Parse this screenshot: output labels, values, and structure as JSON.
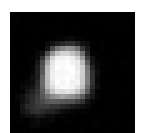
{
  "image": {
    "kind": "grayscale-astronomical-blob",
    "description": "Low-resolution pixelated grayscale image of a small irregular bright object on a black sky background",
    "width_px": 147,
    "height_px": 133,
    "background_color": "#ffffff",
    "field_color": "#000000",
    "field": {
      "left_px": 10,
      "top_px": 12,
      "width_px": 125,
      "height_px": 121
    },
    "colormap": "grayscale",
    "min_level": 0,
    "max_level": 255,
    "block_size_px": 5
  },
  "chart_data": {
    "type": "heatmap",
    "title": "",
    "xlabel": "",
    "ylabel": "",
    "colormap": "gray",
    "vmin": 0,
    "vmax": 255,
    "grid": false,
    "legend": "none",
    "nx": 25,
    "ny": 25,
    "xlim": [
      0,
      25
    ],
    "ylim": [
      0,
      25
    ],
    "xticklabels": [],
    "yticklabels": [],
    "values": [
      [
        0,
        0,
        0,
        0,
        0,
        0,
        0,
        0,
        0,
        0,
        0,
        0,
        0,
        0,
        0,
        0,
        0,
        0,
        0,
        0,
        0,
        0,
        0,
        0,
        0
      ],
      [
        0,
        0,
        0,
        0,
        0,
        0,
        0,
        0,
        0,
        0,
        0,
        0,
        0,
        0,
        0,
        0,
        0,
        0,
        0,
        0,
        0,
        0,
        0,
        0,
        0
      ],
      [
        0,
        0,
        0,
        0,
        0,
        0,
        0,
        0,
        0,
        0,
        0,
        0,
        0,
        0,
        0,
        0,
        0,
        0,
        0,
        0,
        0,
        0,
        0,
        0,
        0
      ],
      [
        0,
        0,
        0,
        0,
        0,
        0,
        0,
        0,
        0,
        0,
        0,
        0,
        0,
        0,
        0,
        0,
        0,
        0,
        0,
        0,
        0,
        0,
        0,
        0,
        0
      ],
      [
        0,
        0,
        0,
        0,
        0,
        0,
        0,
        0,
        0,
        0,
        0,
        0,
        0,
        0,
        0,
        0,
        0,
        0,
        0,
        0,
        0,
        0,
        0,
        0,
        0
      ],
      [
        0,
        0,
        0,
        0,
        0,
        0,
        0,
        0,
        2,
        4,
        6,
        8,
        8,
        6,
        4,
        2,
        0,
        0,
        0,
        0,
        0,
        0,
        0,
        0,
        0
      ],
      [
        0,
        0,
        0,
        0,
        0,
        0,
        0,
        4,
        14,
        30,
        42,
        46,
        44,
        34,
        18,
        6,
        2,
        0,
        0,
        0,
        0,
        0,
        0,
        0,
        0
      ],
      [
        0,
        0,
        0,
        0,
        0,
        0,
        6,
        26,
        72,
        118,
        140,
        146,
        138,
        112,
        62,
        20,
        4,
        0,
        0,
        0,
        0,
        0,
        0,
        0,
        0
      ],
      [
        0,
        0,
        0,
        0,
        0,
        4,
        22,
        78,
        150,
        192,
        206,
        208,
        200,
        172,
        112,
        40,
        8,
        2,
        0,
        0,
        0,
        0,
        0,
        0,
        0
      ],
      [
        0,
        0,
        0,
        0,
        2,
        10,
        48,
        130,
        206,
        234,
        240,
        242,
        238,
        216,
        158,
        66,
        16,
        4,
        0,
        0,
        0,
        0,
        0,
        0,
        0
      ],
      [
        0,
        0,
        0,
        0,
        4,
        18,
        72,
        168,
        228,
        246,
        250,
        252,
        248,
        234,
        186,
        92,
        26,
        6,
        2,
        0,
        0,
        0,
        0,
        0,
        0
      ],
      [
        0,
        0,
        0,
        2,
        8,
        26,
        88,
        184,
        236,
        250,
        252,
        252,
        250,
        240,
        200,
        112,
        36,
        10,
        2,
        0,
        0,
        0,
        0,
        0,
        0
      ],
      [
        0,
        0,
        0,
        2,
        10,
        30,
        96,
        190,
        238,
        250,
        252,
        252,
        250,
        242,
        206,
        124,
        44,
        12,
        2,
        0,
        0,
        0,
        0,
        0,
        0
      ],
      [
        0,
        0,
        0,
        4,
        12,
        34,
        100,
        192,
        238,
        250,
        252,
        252,
        250,
        242,
        208,
        130,
        50,
        14,
        2,
        0,
        0,
        0,
        0,
        0,
        0
      ],
      [
        0,
        0,
        2,
        6,
        16,
        40,
        102,
        188,
        234,
        248,
        250,
        250,
        248,
        238,
        202,
        128,
        50,
        14,
        2,
        0,
        0,
        0,
        0,
        0,
        0
      ],
      [
        0,
        0,
        4,
        10,
        24,
        48,
        100,
        178,
        224,
        242,
        246,
        246,
        242,
        228,
        186,
        114,
        42,
        12,
        2,
        0,
        0,
        0,
        0,
        0,
        0
      ],
      [
        0,
        2,
        8,
        18,
        34,
        56,
        94,
        154,
        196,
        218,
        226,
        224,
        216,
        196,
        152,
        86,
        30,
        8,
        2,
        0,
        0,
        0,
        0,
        0,
        0
      ],
      [
        0,
        4,
        14,
        28,
        46,
        62,
        84,
        116,
        142,
        156,
        160,
        156,
        146,
        126,
        94,
        52,
        18,
        4,
        0,
        0,
        0,
        0,
        0,
        0,
        0
      ],
      [
        0,
        6,
        20,
        36,
        52,
        62,
        72,
        84,
        92,
        94,
        92,
        86,
        76,
        62,
        44,
        24,
        8,
        2,
        0,
        0,
        0,
        0,
        0,
        0,
        0
      ],
      [
        0,
        6,
        22,
        38,
        52,
        58,
        60,
        58,
        54,
        48,
        42,
        34,
        26,
        18,
        12,
        6,
        2,
        0,
        0,
        0,
        0,
        0,
        0,
        0,
        0
      ],
      [
        0,
        4,
        16,
        30,
        42,
        46,
        44,
        38,
        30,
        22,
        16,
        10,
        6,
        4,
        2,
        0,
        0,
        0,
        0,
        0,
        0,
        0,
        0,
        0,
        0
      ],
      [
        0,
        2,
        8,
        16,
        24,
        26,
        24,
        18,
        12,
        8,
        4,
        2,
        2,
        0,
        0,
        0,
        0,
        0,
        0,
        0,
        0,
        0,
        0,
        0,
        0
      ],
      [
        0,
        0,
        2,
        6,
        10,
        12,
        10,
        6,
        4,
        2,
        0,
        0,
        0,
        0,
        0,
        0,
        0,
        0,
        0,
        0,
        0,
        0,
        0,
        0,
        0
      ],
      [
        0,
        0,
        0,
        2,
        4,
        4,
        4,
        2,
        0,
        0,
        0,
        0,
        0,
        0,
        0,
        0,
        0,
        0,
        0,
        0,
        0,
        0,
        0,
        0,
        0
      ],
      [
        0,
        0,
        0,
        0,
        0,
        0,
        0,
        0,
        0,
        0,
        0,
        0,
        0,
        0,
        0,
        0,
        0,
        0,
        0,
        0,
        0,
        0,
        0,
        0,
        0
      ]
    ],
    "features": [
      {
        "name": "primary-lobe",
        "center_cell": [
          11,
          12
        ],
        "peak_value": 252,
        "radius_cells": 5.5
      },
      {
        "name": "secondary-lobe",
        "center_cell": [
          5,
          18
        ],
        "peak_value": 72,
        "radius_cells": 3.5
      }
    ],
    "noise_amplitude": 6
  }
}
